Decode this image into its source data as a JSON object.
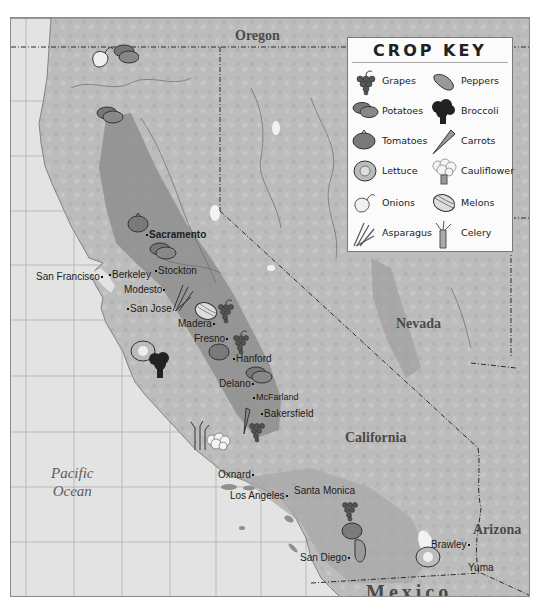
{
  "map": {
    "title": "California Crop Map",
    "regions": {
      "oregon": "Oregon",
      "nevada": "Nevada",
      "california": "California",
      "arizona": "Arizona",
      "mexico": "Mexico"
    },
    "ocean": {
      "line1": "Pacific",
      "line2": "Ocean"
    },
    "cities": [
      {
        "name": "Sacramento",
        "bold": true
      },
      {
        "name": "San Francisco"
      },
      {
        "name": "Berkeley"
      },
      {
        "name": "Stockton"
      },
      {
        "name": "Modesto"
      },
      {
        "name": "San Jose"
      },
      {
        "name": "Madera"
      },
      {
        "name": "Fresno"
      },
      {
        "name": "Hanford"
      },
      {
        "name": "Delano"
      },
      {
        "name": "McFarland"
      },
      {
        "name": "Bakersfield"
      },
      {
        "name": "Oxnard"
      },
      {
        "name": "Los Angeles"
      },
      {
        "name": "Santa Monica"
      },
      {
        "name": "San Diego"
      },
      {
        "name": "Brawley"
      },
      {
        "name": "Yuma"
      }
    ]
  },
  "crop_key": {
    "title": "CROP KEY",
    "items": [
      {
        "label": "Grapes",
        "icon": "grapes-icon"
      },
      {
        "label": "Peppers",
        "icon": "pepper-icon"
      },
      {
        "label": "Potatoes",
        "icon": "potatoes-icon"
      },
      {
        "label": "Broccoli",
        "icon": "broccoli-icon"
      },
      {
        "label": "Tomatoes",
        "icon": "tomato-icon"
      },
      {
        "label": "Carrots",
        "icon": "carrot-icon"
      },
      {
        "label": "Lettuce",
        "icon": "lettuce-icon"
      },
      {
        "label": "Cauliflower",
        "icon": "cauliflower-icon"
      },
      {
        "label": "Onions",
        "icon": "onion-icon"
      },
      {
        "label": "Melons",
        "icon": "melon-icon"
      },
      {
        "label": "Asparagus",
        "icon": "asparagus-icon"
      },
      {
        "label": "Celery",
        "icon": "celery-icon"
      }
    ]
  },
  "colors": {
    "ocean": "#e3e3e3",
    "land": "#bdbdbd",
    "valley": "#8f8f8f",
    "border": "#2a2a2a"
  }
}
